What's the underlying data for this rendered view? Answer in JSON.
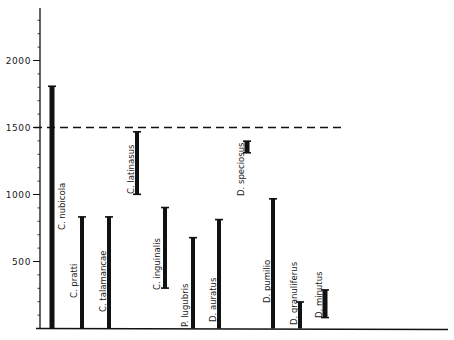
{
  "chart_data": {
    "type": "bar",
    "subtype": "range-bar (floating vertical bars)",
    "title": "",
    "xlabel": "",
    "ylabel": "",
    "ylim": [
      0,
      2400
    ],
    "y_ticks": [
      500,
      1000,
      1500,
      2000
    ],
    "y_minor_tick_step": 100,
    "grid": false,
    "legend": null,
    "reference_line": {
      "value": 1500,
      "style": "dashed"
    },
    "categories": [
      "C. nubicola",
      "C. pratti",
      "C. talamancae",
      "C. latinasus",
      "C. inguinalis",
      "P. lugubris",
      "D. auratus",
      "D. speciosus",
      "D. pumilio",
      "D. granuliferus",
      "D. minutus"
    ],
    "ranges": [
      {
        "name": "C. nubicola",
        "low": 0,
        "high": 1810
      },
      {
        "name": "C. pratti",
        "low": 0,
        "high": 835
      },
      {
        "name": "C. talamancae",
        "low": 0,
        "high": 835
      },
      {
        "name": "C. latinasus",
        "low": 1000,
        "high": 1470
      },
      {
        "name": "C. inguinalis",
        "low": 300,
        "high": 905
      },
      {
        "name": "P. lugubris",
        "low": 0,
        "high": 680
      },
      {
        "name": "D. auratus",
        "low": 0,
        "high": 815
      },
      {
        "name": "D. speciosus",
        "low": 1310,
        "high": 1400
      },
      {
        "name": "D. pumilio",
        "low": 0,
        "high": 970
      },
      {
        "name": "D. granuliferus",
        "low": 0,
        "high": 200
      },
      {
        "name": "D. minutus",
        "low": 80,
        "high": 290
      }
    ]
  },
  "layout": {
    "axis_x": 40,
    "baseline_y": 328.5,
    "axis_top_y": 8,
    "axis_right_x": 448,
    "px_per_unit": 0.134,
    "dash_end_x": 342,
    "bar_x": [
      52,
      82,
      109,
      137,
      165,
      193,
      219,
      247,
      273,
      300,
      325
    ],
    "bar_width": [
      5,
      4,
      4,
      4,
      4,
      4,
      4,
      5,
      4,
      4,
      5
    ],
    "label_x": [
      62,
      74,
      103,
      131,
      157,
      185,
      213,
      241,
      267,
      294,
      319
    ],
    "label_bottom_y": [
      230,
      298,
      312,
      194,
      290,
      327,
      322,
      196,
      303,
      325,
      318
    ]
  },
  "colors": {
    "ink": "#111111",
    "background": "#ffffff"
  }
}
